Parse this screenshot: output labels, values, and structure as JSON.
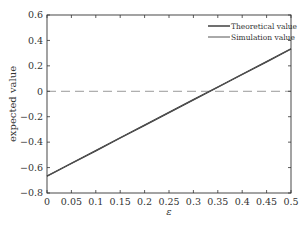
{
  "chart_data": {
    "type": "line",
    "title": "",
    "xlabel": "ε",
    "ylabel": "expected value",
    "xlim": [
      0,
      0.5
    ],
    "ylim": [
      -0.8,
      0.6
    ],
    "grid": false,
    "legend_position": "upper right",
    "x_ticks": [
      "0",
      "0.05",
      "0.1",
      "0.15",
      "0.2",
      "0.25",
      "0.3",
      "0.35",
      "0.4",
      "0.45",
      "0.5"
    ],
    "y_ticks": [
      "0.6",
      "0.4",
      "0.2",
      "0",
      "−0.2",
      "−0.4",
      "−0.6",
      "−0.8"
    ],
    "x": [
      0,
      0.05,
      0.1,
      0.15,
      0.2,
      0.25,
      0.3,
      0.35,
      0.4,
      0.45,
      0.5
    ],
    "series": [
      {
        "name": "Theoretical value",
        "values": [
          -0.667,
          -0.567,
          -0.467,
          -0.367,
          -0.267,
          -0.167,
          -0.067,
          0.033,
          0.133,
          0.233,
          0.333
        ],
        "color": "#333333"
      },
      {
        "name": "Simulation value",
        "values": [
          -0.667,
          -0.567,
          -0.467,
          -0.367,
          -0.267,
          -0.167,
          -0.067,
          0.033,
          0.133,
          0.233,
          0.333
        ],
        "color": "#555555"
      }
    ],
    "annotations": [
      {
        "type": "reference_line",
        "y": 0,
        "style": "dashed",
        "color": "#999999"
      }
    ]
  }
}
